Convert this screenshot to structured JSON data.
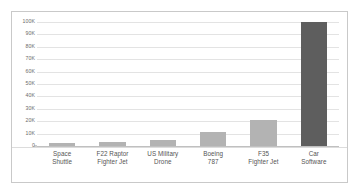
{
  "chart_data": {
    "type": "bar",
    "title": "",
    "subtitle": "",
    "xlabel": "",
    "ylabel": "",
    "ylim": [
      0,
      100000
    ],
    "grid": true,
    "legend": false,
    "categories": [
      "Space Shuttle",
      "F22 Raptor Fighter Jet",
      "US Military Drone",
      "Boeing 787",
      "F35 Fighter Jet",
      "Car Software"
    ],
    "category_lines": [
      [
        "Space",
        "Shuttle"
      ],
      [
        "F22 Raptor",
        "Fighter Jet"
      ],
      [
        "US Military",
        "Drone"
      ],
      [
        "Boeing",
        "787"
      ],
      [
        "F35",
        "Fighter Jet"
      ],
      [
        "Car",
        "Software"
      ]
    ],
    "values": [
      2500,
      3000,
      5000,
      11000,
      21000,
      100000
    ],
    "bar_colors": [
      "#b3b3b3",
      "#b3b3b3",
      "#b3b3b3",
      "#b3b3b3",
      "#b3b3b3",
      "#5e5e5e"
    ],
    "ytick_values": [
      0,
      10000,
      20000,
      30000,
      40000,
      50000,
      60000,
      70000,
      80000,
      90000,
      100000
    ],
    "ytick_labels": [
      "0",
      "10K",
      "20K",
      "30K",
      "40K",
      "50K",
      "60K",
      "70K",
      "80K",
      "90K",
      "100K"
    ]
  },
  "style": {
    "bar_color": "#b3b3b3",
    "highlight_color": "#5e5e5e",
    "gridline_color": "#e3e3e3",
    "frame_color": "#c9c9c9",
    "background": "#ffffff",
    "label_color": "#555555",
    "tick_label_color": "#6b6b6b"
  }
}
